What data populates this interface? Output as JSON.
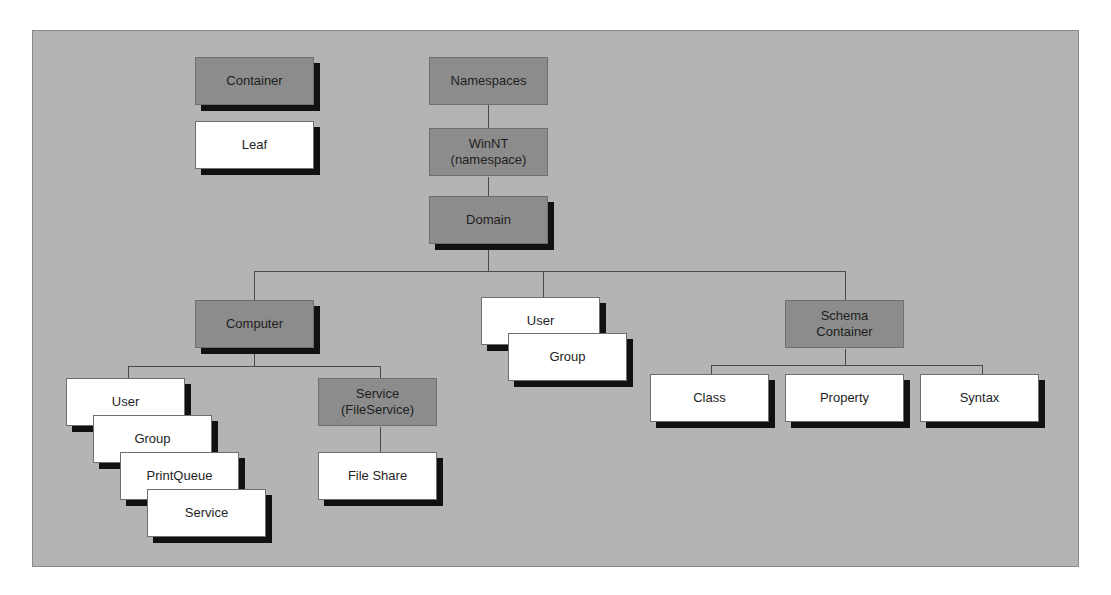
{
  "legend": {
    "container": "Container",
    "leaf": "Leaf"
  },
  "nodes": {
    "namespaces": "Namespaces",
    "winnt_line1": "WinNT",
    "winnt_line2": "(namespace)",
    "domain": "Domain",
    "computer": "Computer",
    "computer_children": [
      "User",
      "Group",
      "PrintQueue",
      "Service"
    ],
    "service_line1": "Service",
    "service_line2": "(FileService)",
    "file_share": "File Share",
    "domain_user": "User",
    "domain_group": "Group",
    "schema_line1": "Schema",
    "schema_line2": "Container",
    "schema_children": [
      "Class",
      "Property",
      "Syntax"
    ]
  },
  "colors": {
    "background": "#b4b4b4",
    "container_fill": "#8c8c8c",
    "leaf_fill": "#ffffff",
    "shadow": "#111111"
  }
}
